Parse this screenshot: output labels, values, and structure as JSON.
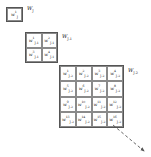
{
  "figure": {
    "background_color": "#ffffff",
    "line_color": "#555555",
    "cell_border_color": "#8a8a8a",
    "text_color": "#1a1a1a"
  },
  "levels": [
    {
      "id": "j",
      "label": "W",
      "label_sub": "J",
      "rows": 1,
      "cols": 1,
      "symbol": "w",
      "subscript": "J",
      "cells": [
        {
          "symbol": "w",
          "sup": "1",
          "sub": "J"
        }
      ]
    },
    {
      "id": "j-1",
      "label": "W",
      "label_sub": "J-1",
      "rows": 2,
      "cols": 2,
      "symbol": "w",
      "subscript": "J-1",
      "cells": [
        {
          "symbol": "w",
          "sup": "1",
          "sub": "J-1"
        },
        {
          "symbol": "w",
          "sup": "2",
          "sub": "J-1"
        },
        {
          "symbol": "w",
          "sup": "3",
          "sub": "J-1"
        },
        {
          "symbol": "w",
          "sup": "4",
          "sub": "J-1"
        }
      ]
    },
    {
      "id": "j-2",
      "label": "W",
      "label_sub": "J-2",
      "rows": 4,
      "cols": 4,
      "symbol": "w",
      "subscript": "J-2",
      "cells": [
        {
          "symbol": "w",
          "sup": "1",
          "sub": "J-2"
        },
        {
          "symbol": "w",
          "sup": "2",
          "sub": "J-2"
        },
        {
          "symbol": "w",
          "sup": "3",
          "sub": "J-2"
        },
        {
          "symbol": "w",
          "sup": "4",
          "sub": "J-2"
        },
        {
          "symbol": "w",
          "sup": "5",
          "sub": "J-2"
        },
        {
          "symbol": "w",
          "sup": "6",
          "sub": "J-2"
        },
        {
          "symbol": "w",
          "sup": "7",
          "sub": "J-2"
        },
        {
          "symbol": "w",
          "sup": "8",
          "sub": "J-2"
        },
        {
          "symbol": "w",
          "sup": "9",
          "sub": "J-2"
        },
        {
          "symbol": "w",
          "sup": "10",
          "sub": "J-2"
        },
        {
          "symbol": "w",
          "sup": "11",
          "sub": "J-2"
        },
        {
          "symbol": "w",
          "sup": "12",
          "sub": "J-2"
        },
        {
          "symbol": "w",
          "sup": "13",
          "sub": "J-2"
        },
        {
          "symbol": "w",
          "sup": "14",
          "sub": "J-2"
        },
        {
          "symbol": "w",
          "sup": "15",
          "sub": "J-2"
        },
        {
          "symbol": "w",
          "sup": "16",
          "sub": "J-2"
        }
      ]
    }
  ],
  "annotations": {
    "zoom_arrow": {
      "style": "dashed",
      "direction": "down-right",
      "color": "#555555"
    }
  }
}
